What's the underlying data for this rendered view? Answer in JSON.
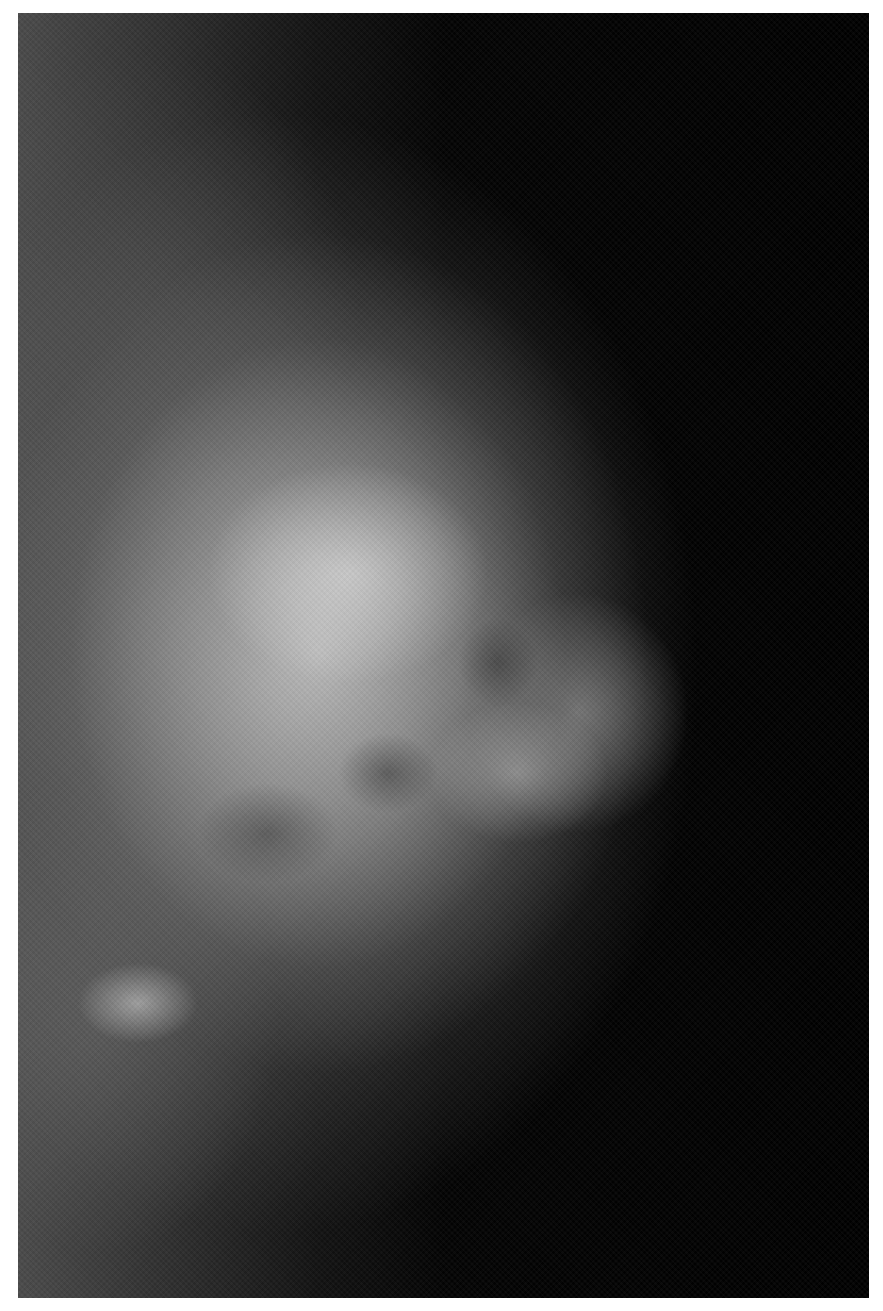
{
  "image": {
    "type": "grayscale-radiograph",
    "subject": "mammogram",
    "view": "lateral profile, tissue facing right",
    "colors": {
      "background": "#000000",
      "tissue_bright": "#d2d2d2",
      "tissue_mid": "#8c8c8c",
      "frame": "#ffffff"
    }
  }
}
